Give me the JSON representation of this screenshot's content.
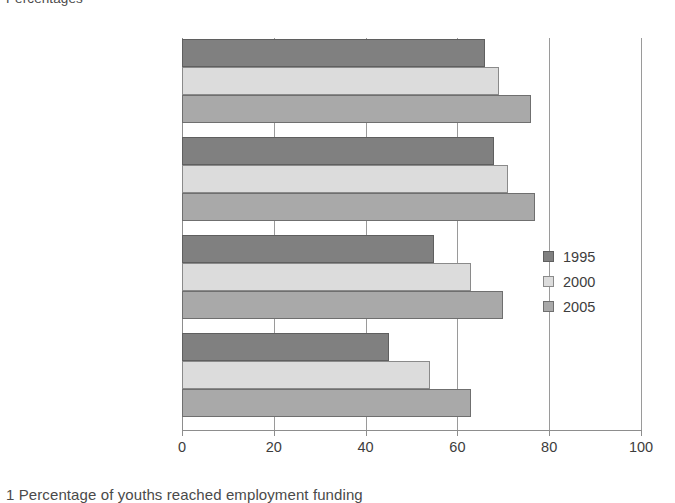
{
  "units_label": "Percentages",
  "caption": "1 Percentage of youths reached employment funding",
  "legend": {
    "position": "right-middle",
    "entries": [
      {
        "label": "1995",
        "color": "#808080"
      },
      {
        "label": "2000",
        "color": "#dcdcdc"
      },
      {
        "label": "2005",
        "color": "#a9a9a9"
      }
    ]
  },
  "chart_data": {
    "type": "bar",
    "orientation": "horizontal",
    "title": "",
    "subtitle": "",
    "xlabel": "",
    "ylabel": "",
    "units": "Percentages",
    "categories": [
      "United Kingdom",
      "England & Wales",
      "Scotland",
      "Northern Ireland"
    ],
    "series": [
      {
        "name": "1995",
        "color": "#808080",
        "values": [
          66,
          68,
          55,
          45
        ]
      },
      {
        "name": "2000",
        "color": "#dcdcdc",
        "values": [
          69,
          71,
          63,
          54
        ]
      },
      {
        "name": "2005",
        "color": "#a9a9a9",
        "values": [
          76,
          77,
          70,
          63
        ]
      }
    ],
    "xlim": [
      0,
      100
    ],
    "xticks": [
      0,
      20,
      40,
      60,
      80,
      100
    ],
    "xtick_labels": [
      "0",
      "20",
      "40",
      "60",
      "80",
      "100"
    ],
    "grid": "vertical",
    "legend_position": "right"
  },
  "axis": {
    "tick_labels": [
      "0",
      "20",
      "40",
      "60",
      "80",
      "100"
    ]
  }
}
